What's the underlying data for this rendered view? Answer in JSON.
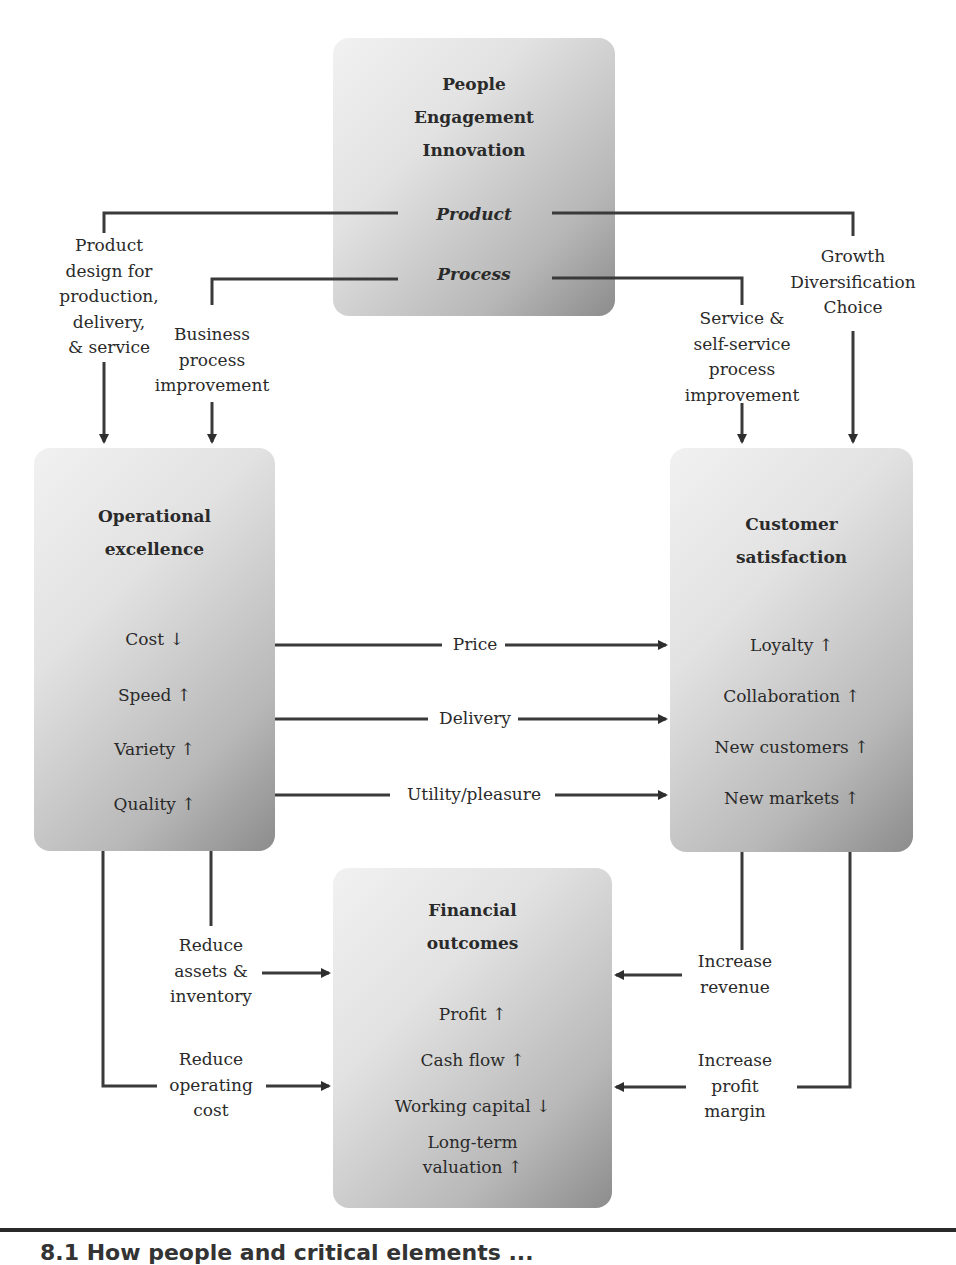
{
  "diagram": {
    "top_box": {
      "title_lines": [
        "People",
        "Engagement",
        "Innovation"
      ],
      "product_label": "Product",
      "process_label": "Process"
    },
    "left_box": {
      "title_lines": [
        "Operational",
        "excellence"
      ],
      "items": [
        "Cost ↓",
        "Speed ↑",
        "Variety ↑",
        "Quality ↑"
      ]
    },
    "right_box": {
      "title_lines": [
        "Customer",
        "satisfaction"
      ],
      "items": [
        "Loyalty ↑",
        "Collaboration ↑",
        "New customers ↑",
        "New markets ↑"
      ]
    },
    "bottom_box": {
      "title_lines": [
        "Financial",
        "outcomes"
      ],
      "items": [
        "Profit ↑",
        "Cash flow ↑",
        "Working capital ↓",
        "Long-term",
        "valuation ↑"
      ]
    },
    "connector_labels": {
      "product_design": [
        "Product",
        "design for",
        "production,",
        "delivery,",
        "& service"
      ],
      "business_process": [
        "Business",
        "process",
        "improvement"
      ],
      "service_process": [
        "Service &",
        "self-service",
        "process",
        "improvement"
      ],
      "growth": [
        "Growth",
        "Diversification",
        "Choice"
      ],
      "price": "Price",
      "delivery": "Delivery",
      "utility": "Utility/pleasure",
      "reduce_assets": [
        "Reduce",
        "assets &",
        "inventory"
      ],
      "reduce_cost": [
        "Reduce",
        "operating",
        "cost"
      ],
      "increase_revenue": [
        "Increase",
        "revenue"
      ],
      "increase_margin": [
        "Increase",
        "profit",
        "margin"
      ]
    },
    "caption_partial": "8.1 How people and critical elements ..."
  },
  "colors": {
    "line": "#3a3a3a",
    "box_light": "#f1f1f1",
    "box_dark": "#8c8c8c"
  }
}
